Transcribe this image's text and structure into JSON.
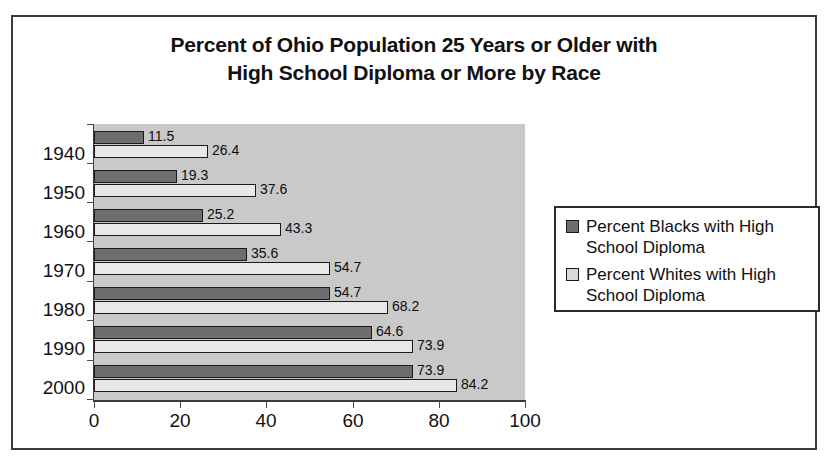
{
  "chart_data": {
    "type": "bar",
    "orientation": "horizontal",
    "title": "Percent of Ohio Population 25 Years or Older with High School Diploma or More by Race",
    "title_lines": [
      "Percent of Ohio Population 25 Years or Older with",
      "High School Diploma or More by Race"
    ],
    "categories": [
      "1940",
      "1950",
      "1960",
      "1970",
      "1980",
      "1990",
      "2000"
    ],
    "series": [
      {
        "name": "Percent Blacks with High School Diploma",
        "name_lines": [
          "Percent Blacks with High",
          "School Diploma"
        ],
        "color": "#6e6e6e",
        "values": [
          11.5,
          19.3,
          25.2,
          35.6,
          54.7,
          64.6,
          73.9
        ]
      },
      {
        "name": "Percent Whites with High School Diploma",
        "name_lines": [
          "Percent Whites with High",
          "School Diploma"
        ],
        "color": "#e8e8e8",
        "values": [
          26.4,
          37.6,
          43.3,
          54.7,
          68.2,
          73.9,
          84.2
        ]
      }
    ],
    "xlabel": "",
    "ylabel": "",
    "xlim": [
      0,
      100
    ],
    "xticks": [
      0,
      20,
      40,
      60,
      80,
      100
    ],
    "xtick_labels": [
      "0",
      "20",
      "40",
      "60",
      "80",
      "100"
    ],
    "grid": false,
    "legend_position": "right",
    "plot_background": "#c9c9c9",
    "frame_border_color": "#3a3a3a",
    "data_labels_shown": true
  },
  "legend": {
    "entries": [
      {
        "label": "Percent Blacks with High School Diploma",
        "line1": "Percent Blacks with High",
        "line2": "School Diploma",
        "swatch": "#6e6e6e"
      },
      {
        "label": "Percent Whites with High School Diploma",
        "line1": "Percent Whites with High",
        "line2": "School Diploma",
        "swatch": "#d9d9d9"
      }
    ]
  }
}
